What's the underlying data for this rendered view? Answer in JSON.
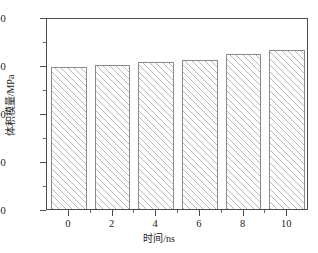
{
  "chart_data": {
    "type": "bar",
    "title": "",
    "subtitle": "",
    "xlabel": "时间/ns",
    "ylabel": "体积模量/MPa",
    "categories": [
      "0",
      "2",
      "4",
      "6",
      "8",
      "10"
    ],
    "x": [
      0,
      2,
      4,
      6,
      8,
      10
    ],
    "values": [
      895,
      900,
      907,
      911,
      922,
      932
    ],
    "series": [
      {
        "name": "体积模量",
        "values": [
          895,
          900,
          907,
          911,
          922,
          932
        ]
      }
    ],
    "ylim": [
      600,
      1000
    ],
    "xlim": [
      -1,
      11
    ],
    "y_major_ticks": [
      600,
      700,
      800,
      900,
      1000
    ],
    "y_major_tick_labels": [
      "600",
      "700",
      "800",
      "900",
      "1 000"
    ],
    "y_minor_ticks": [
      650,
      750,
      850,
      950
    ],
    "x_major_ticks": [
      0,
      2,
      4,
      6,
      8,
      10
    ],
    "x_minor_ticks": [
      1,
      3,
      5,
      7,
      9
    ],
    "grid": false,
    "legend": null,
    "legend_position": "none",
    "bar_fill": "hatched-diagonal",
    "bar_edge_color": "#8a8a8a",
    "bar_hatch_color": "#b9b9b9",
    "axis_color": "#4a4a4a",
    "background": "#ffffff",
    "annotations": []
  },
  "axes": {
    "y_title": "体积模量/MPa",
    "x_title": "时间/ns"
  }
}
